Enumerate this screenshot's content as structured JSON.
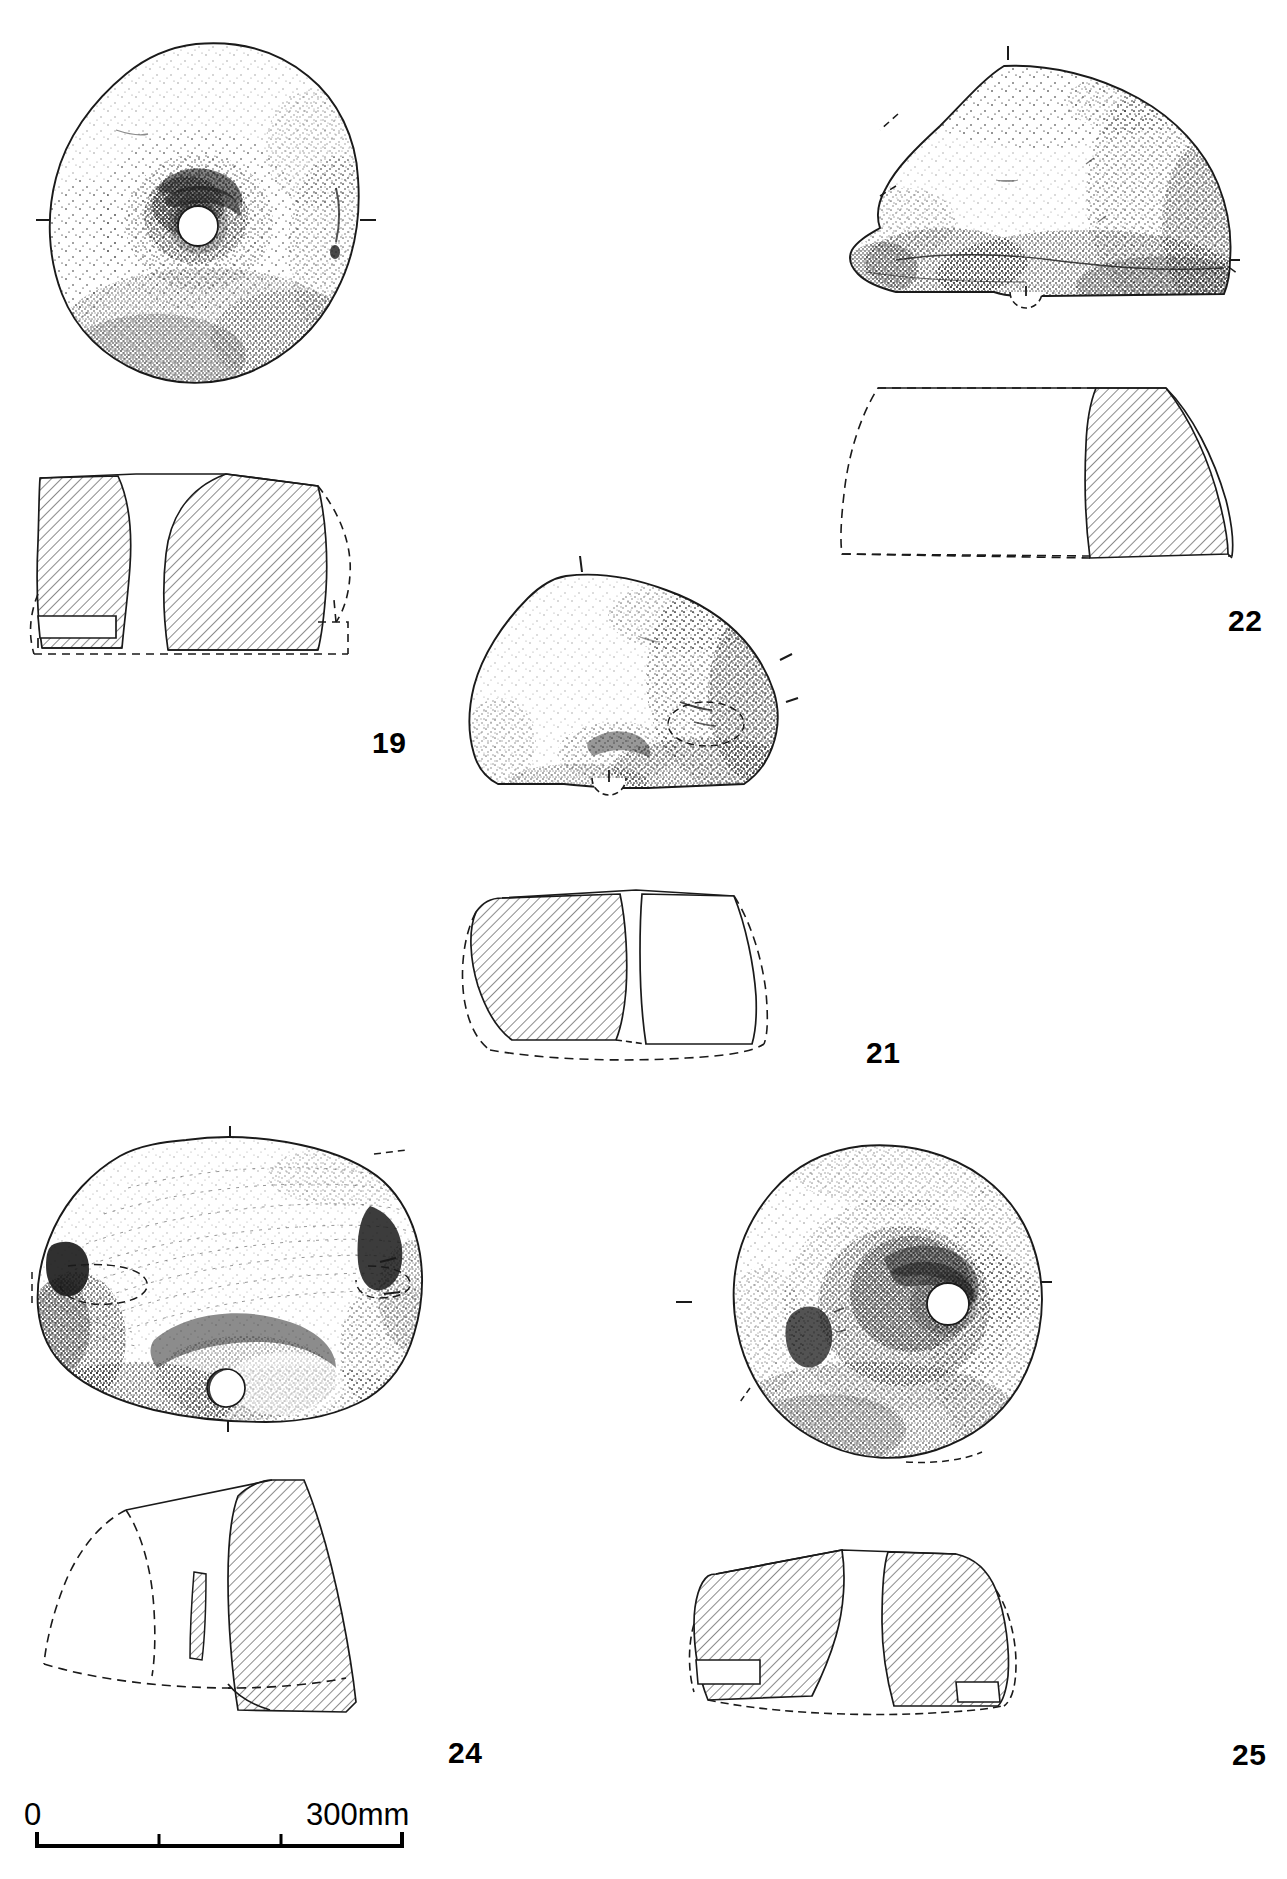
{
  "plate": {
    "kind": "archaeological-artefact-illustration-plate",
    "medium": "ink line drawing with stipple shading and section hatching",
    "background_color": "#ffffff",
    "ink_color": "#1a1a1a",
    "width_px": 1287,
    "height_px": 1879
  },
  "scale": {
    "start_label": "0",
    "end_label": "300mm",
    "unit": "mm",
    "total_value": 300,
    "tick_values": [
      0,
      100,
      200,
      300
    ],
    "bar_left_px": 35,
    "bar_right_px": 403
  },
  "artefacts": [
    {
      "catalogue_number": "19",
      "label": "19",
      "description": "Rotary quern upper stone, near-complete disc with central circular perforation and pecked hopper depression",
      "views": [
        "plan",
        "section"
      ],
      "plan_position": {
        "x": 40,
        "y": 40,
        "w": 340,
        "h": 350
      },
      "section_position": {
        "x": 20,
        "y": 470,
        "w": 360,
        "h": 250
      },
      "label_position": {
        "x": 372,
        "y": 730
      },
      "has_central_perforation": true,
      "section_style": "hatched"
    },
    {
      "catalogue_number": "21",
      "label": "21",
      "description": "Quern fragment, roughly half a disc with part of the central perforation surviving on the lower edge",
      "views": [
        "plan",
        "section"
      ],
      "plan_position": {
        "x": 460,
        "y": 560,
        "w": 330,
        "h": 260
      },
      "section_position": {
        "x": 450,
        "y": 880,
        "w": 390,
        "h": 190
      },
      "label_position": {
        "x": 866,
        "y": 1040
      },
      "has_central_perforation": true,
      "section_style": "hatched-partial"
    },
    {
      "catalogue_number": "22",
      "label": "22",
      "description": "Quern fragment, large segment with dressed upper surface and part of the central perforation at the base",
      "views": [
        "plan",
        "section"
      ],
      "plan_position": {
        "x": 840,
        "y": 50,
        "w": 400,
        "h": 260
      },
      "section_position": {
        "x": 820,
        "y": 380,
        "w": 420,
        "h": 225
      },
      "label_position": {
        "x": 1228,
        "y": 608
      },
      "has_central_perforation": true,
      "section_style": "hatched-partial"
    },
    {
      "catalogue_number": "24",
      "label": "24",
      "description": "Quern fragment with radial tooling striations, lateral handle sockets and a small circular socket on the lower edge",
      "views": [
        "plan",
        "section"
      ],
      "plan_position": {
        "x": 20,
        "y": 1130,
        "w": 420,
        "h": 300
      },
      "section_position": {
        "x": 30,
        "y": 1470,
        "w": 400,
        "h": 270
      },
      "label_position": {
        "x": 448,
        "y": 1740
      },
      "has_central_perforation": true,
      "section_style": "hatched-partial"
    },
    {
      "catalogue_number": "25",
      "label": "25",
      "description": "Rotary quern upper stone, sub-circular disc with central perforation, hopper depression and a lateral handle socket",
      "views": [
        "plan",
        "section"
      ],
      "plan_position": {
        "x": 680,
        "y": 1140,
        "w": 370,
        "h": 330
      },
      "section_position": {
        "x": 660,
        "y": 1530,
        "w": 390,
        "h": 210
      },
      "label_position": {
        "x": 1232,
        "y": 1742
      },
      "has_central_perforation": true,
      "section_style": "hatched"
    }
  ]
}
